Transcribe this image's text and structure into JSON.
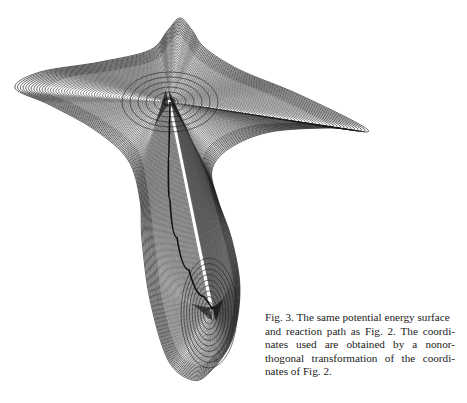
{
  "figure": {
    "label": "Fig. 3.",
    "caption_text": "The same potential energy surface and reaction path as Fig. 2. The coordinates used are obtained by a nonorthogonal transformation of the coordinates of Fig. 2.",
    "caption_lines": [
      "Fig. 3.  The same potential energy surface",
      "and reaction path as Fig. 2. The coordi-",
      "nates used are obtained by a nonor-",
      "thogonal transformation of the coordi-",
      "nates of Fig. 2."
    ],
    "content": "contour plot of a potential energy surface with reaction path",
    "minima": [
      {
        "name": "upper-minimum",
        "x": 170,
        "y": 102
      },
      {
        "name": "lower-minimum",
        "x": 212,
        "y": 308
      }
    ],
    "outline_points": [
      [
        180,
        18
      ],
      [
        192,
        30
      ],
      [
        205,
        48
      ],
      [
        240,
        70
      ],
      [
        300,
        95
      ],
      [
        368,
        130
      ],
      [
        330,
        128
      ],
      [
        270,
        132
      ],
      [
        230,
        148
      ],
      [
        212,
        170
      ],
      [
        218,
        200
      ],
      [
        232,
        240
      ],
      [
        240,
        290
      ],
      [
        232,
        340
      ],
      [
        210,
        372
      ],
      [
        192,
        380
      ],
      [
        168,
        360
      ],
      [
        150,
        300
      ],
      [
        142,
        240
      ],
      [
        140,
        200
      ],
      [
        128,
        160
      ],
      [
        95,
        130
      ],
      [
        50,
        105
      ],
      [
        15,
        88
      ],
      [
        40,
        72
      ],
      [
        100,
        62
      ],
      [
        150,
        50
      ],
      [
        168,
        30
      ]
    ],
    "contour_count": 55,
    "reaction_path": [
      [
        170,
        102
      ],
      [
        169,
        140
      ],
      [
        168,
        180
      ],
      [
        172,
        220
      ],
      [
        182,
        255
      ],
      [
        196,
        285
      ],
      [
        212,
        308
      ]
    ],
    "line_color": "#1a1a1a"
  }
}
